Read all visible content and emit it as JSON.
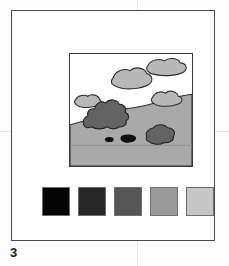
{
  "figure": {
    "caption_number": "3",
    "plate_border_color": "#4a4a4a"
  },
  "scene": {
    "name": "landscape-illustration",
    "frame_border_color": "#3a3a3a",
    "sky_color": "#ffffff",
    "ground_color": "#a9a9a9",
    "ground_outline_color": "#303030",
    "cloud_color": "#b8b8b8",
    "cloud_outline_color": "#2e2e2e",
    "rock_color": "#636363",
    "rock_outline_color": "#252525",
    "spot_color": "#0e0e0e",
    "elements": [
      {
        "name": "cloud-upper-right",
        "label": "cloud"
      },
      {
        "name": "cloud-upper-center",
        "label": "cloud"
      },
      {
        "name": "cloud-middle-right",
        "label": "cloud"
      },
      {
        "name": "cloud-left-small",
        "label": "cloud"
      },
      {
        "name": "rock-large-left",
        "label": "rock outcrop"
      },
      {
        "name": "rock-right",
        "label": "rock"
      },
      {
        "name": "spot-small-left",
        "label": "dark spot"
      },
      {
        "name": "spot-small-right",
        "label": "dark spot"
      },
      {
        "name": "ground-hill",
        "label": "hillside"
      },
      {
        "name": "horizon-line",
        "label": "lower ground line"
      }
    ]
  },
  "swatches": {
    "title": "grayscale-value-scale",
    "items": [
      {
        "name": "swatch-1",
        "label": "value 1",
        "color": "#050505"
      },
      {
        "name": "swatch-2",
        "label": "value 2",
        "color": "#262626"
      },
      {
        "name": "swatch-3",
        "label": "value 3",
        "color": "#555555"
      },
      {
        "name": "swatch-4",
        "label": "value 4",
        "color": "#9a9a9a"
      },
      {
        "name": "swatch-5",
        "label": "value 5",
        "color": "#c6c6c6"
      }
    ]
  }
}
